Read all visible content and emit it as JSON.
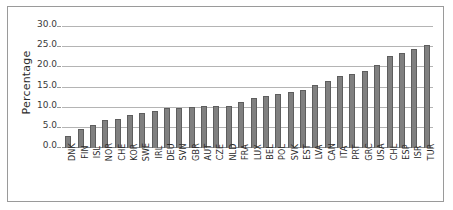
{
  "chart_data": {
    "type": "bar",
    "title": "",
    "xlabel": "",
    "ylabel": "Percentage",
    "ylim": [
      0,
      30
    ],
    "yticks": [
      "0.0",
      "5.0",
      "10.0",
      "15.0",
      "20.0",
      "25.0",
      "30.0"
    ],
    "ytick_values": [
      0,
      5,
      10,
      15,
      20,
      25,
      30
    ],
    "grid": "horizontal",
    "legend": "none",
    "orientation": "vertical",
    "bar_color": "#808080",
    "bar_edge_color": "#5e5e5e",
    "gridline_color": "#b4b4b4",
    "frame_color": "#9a9a9a",
    "background_color": "#ffffff",
    "categories": [
      "DNK",
      "FIN",
      "ISL",
      "NOR",
      "CHE",
      "KOR",
      "SWE",
      "IRL",
      "DEU",
      "SVN",
      "GBR",
      "AUT",
      "CZE",
      "NLD",
      "FRA",
      "LUX",
      "BEL",
      "POL",
      "SVK",
      "EST",
      "LVA",
      "CAN",
      "ITA",
      "PRT",
      "GRC",
      "USA",
      "CHL",
      "ESP",
      "ISR",
      "TUR"
    ],
    "values": [
      2.9,
      4.7,
      5.6,
      6.9,
      7.2,
      8.1,
      8.6,
      9.2,
      9.8,
      9.8,
      10.1,
      10.3,
      10.4,
      10.4,
      11.4,
      12.5,
      12.8,
      13.5,
      13.8,
      14.5,
      15.5,
      16.7,
      17.8,
      18.4,
      19.0,
      20.6,
      22.8,
      23.5,
      24.5,
      25.5
    ]
  }
}
